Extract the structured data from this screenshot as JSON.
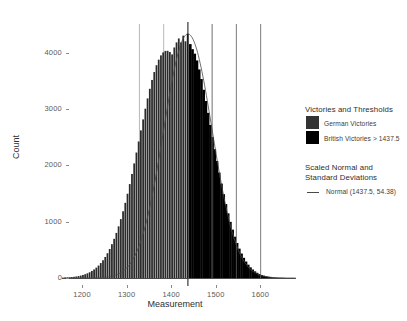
{
  "chart_data": {
    "type": "bar",
    "title": "",
    "xlabel": "Measurement",
    "ylabel": "Count",
    "xlim": [
      1155,
      1680
    ],
    "ylim": [
      0,
      4400
    ],
    "xticks": [
      1200,
      1300,
      1400,
      1500,
      1600
    ],
    "xtick_labels": [
      "1200",
      "1300",
      "1400",
      "1500",
      "1600"
    ],
    "yticks": [
      0,
      1000,
      2000,
      3000,
      4000
    ],
    "ytick_labels": [
      "0",
      "1000",
      "2000",
      "3000",
      "4000"
    ],
    "grid": false,
    "legend_position": "right",
    "bin_width": 5,
    "threshold": 1437.5,
    "normal_mean": 1437.5,
    "normal_sd": 54.38,
    "sd_lines": [
      1491.88,
      1546.26,
      1600.64,
      1383.12,
      1328.74
    ],
    "colors": {
      "german_bars": "#2b2b2b",
      "british_bars": "#000000",
      "normal_curve": "#4a4a4a",
      "threshold_line": "#111111",
      "axis": "#4a4a4a",
      "tick_text": "#5a5a5a",
      "background": "#ffffff"
    },
    "series": [
      {
        "name": "German Victories",
        "color": "#2b2b2b",
        "description": "Bins at or below the 1437.5 threshold"
      },
      {
        "name": "British Victories > 1437.5",
        "color": "#000000",
        "description": "Bins above the 1437.5 threshold"
      }
    ],
    "bins": [
      {
        "x": 1162.5,
        "count": 8
      },
      {
        "x": 1167.5,
        "count": 10
      },
      {
        "x": 1172.5,
        "count": 13
      },
      {
        "x": 1177.5,
        "count": 17
      },
      {
        "x": 1182.5,
        "count": 21
      },
      {
        "x": 1187.5,
        "count": 27
      },
      {
        "x": 1192.5,
        "count": 34
      },
      {
        "x": 1197.5,
        "count": 43
      },
      {
        "x": 1202.5,
        "count": 54
      },
      {
        "x": 1207.5,
        "count": 67
      },
      {
        "x": 1212.5,
        "count": 83
      },
      {
        "x": 1217.5,
        "count": 102
      },
      {
        "x": 1222.5,
        "count": 125
      },
      {
        "x": 1227.5,
        "count": 152
      },
      {
        "x": 1232.5,
        "count": 184
      },
      {
        "x": 1237.5,
        "count": 221
      },
      {
        "x": 1242.5,
        "count": 265
      },
      {
        "x": 1247.5,
        "count": 315
      },
      {
        "x": 1252.5,
        "count": 373
      },
      {
        "x": 1257.5,
        "count": 440
      },
      {
        "x": 1262.5,
        "count": 515
      },
      {
        "x": 1267.5,
        "count": 600
      },
      {
        "x": 1272.5,
        "count": 695
      },
      {
        "x": 1277.5,
        "count": 800
      },
      {
        "x": 1282.5,
        "count": 917
      },
      {
        "x": 1287.5,
        "count": 1045
      },
      {
        "x": 1292.5,
        "count": 1184
      },
      {
        "x": 1297.5,
        "count": 1334
      },
      {
        "x": 1302.5,
        "count": 1495
      },
      {
        "x": 1307.5,
        "count": 1666
      },
      {
        "x": 1312.5,
        "count": 1846
      },
      {
        "x": 1317.5,
        "count": 2033
      },
      {
        "x": 1322.5,
        "count": 2226
      },
      {
        "x": 1327.5,
        "count": 2422
      },
      {
        "x": 1332.5,
        "count": 2619
      },
      {
        "x": 1337.5,
        "count": 2814
      },
      {
        "x": 1342.5,
        "count": 3004
      },
      {
        "x": 1347.5,
        "count": 3186
      },
      {
        "x": 1352.5,
        "count": 3357
      },
      {
        "x": 1357.5,
        "count": 3514
      },
      {
        "x": 1362.5,
        "count": 3654
      },
      {
        "x": 1367.5,
        "count": 3775
      },
      {
        "x": 1372.5,
        "count": 3874
      },
      {
        "x": 1377.5,
        "count": 3950
      },
      {
        "x": 1382.5,
        "count": 4002
      },
      {
        "x": 1387.5,
        "count": 4029
      },
      {
        "x": 1392.5,
        "count": 4031
      },
      {
        "x": 1397.5,
        "count": 4010
      },
      {
        "x": 1402.5,
        "count": 3967
      },
      {
        "x": 1407.5,
        "count": 4090
      },
      {
        "x": 1412.5,
        "count": 4180
      },
      {
        "x": 1417.5,
        "count": 4250
      },
      {
        "x": 1422.5,
        "count": 4180
      },
      {
        "x": 1427.5,
        "count": 4300
      },
      {
        "x": 1432.5,
        "count": 4200
      },
      {
        "x": 1437.5,
        "count": 4330
      },
      {
        "x": 1442.5,
        "count": 4150
      },
      {
        "x": 1447.5,
        "count": 4060
      },
      {
        "x": 1452.5,
        "count": 3980
      },
      {
        "x": 1457.5,
        "count": 3860
      },
      {
        "x": 1462.5,
        "count": 3700
      },
      {
        "x": 1467.5,
        "count": 3530
      },
      {
        "x": 1472.5,
        "count": 3340
      },
      {
        "x": 1477.5,
        "count": 3140
      },
      {
        "x": 1482.5,
        "count": 2930
      },
      {
        "x": 1487.5,
        "count": 2715
      },
      {
        "x": 1492.5,
        "count": 2500
      },
      {
        "x": 1497.5,
        "count": 2285
      },
      {
        "x": 1502.5,
        "count": 2075
      },
      {
        "x": 1507.5,
        "count": 1870
      },
      {
        "x": 1512.5,
        "count": 1675
      },
      {
        "x": 1517.5,
        "count": 1487
      },
      {
        "x": 1522.5,
        "count": 1311
      },
      {
        "x": 1527.5,
        "count": 1147
      },
      {
        "x": 1532.5,
        "count": 996
      },
      {
        "x": 1537.5,
        "count": 858
      },
      {
        "x": 1542.5,
        "count": 733
      },
      {
        "x": 1547.5,
        "count": 621
      },
      {
        "x": 1552.5,
        "count": 521
      },
      {
        "x": 1557.5,
        "count": 434
      },
      {
        "x": 1562.5,
        "count": 358
      },
      {
        "x": 1567.5,
        "count": 292
      },
      {
        "x": 1572.5,
        "count": 236
      },
      {
        "x": 1577.5,
        "count": 189
      },
      {
        "x": 1582.5,
        "count": 150
      },
      {
        "x": 1587.5,
        "count": 118
      },
      {
        "x": 1592.5,
        "count": 92
      },
      {
        "x": 1597.5,
        "count": 71
      },
      {
        "x": 1602.5,
        "count": 54
      },
      {
        "x": 1607.5,
        "count": 41
      },
      {
        "x": 1612.5,
        "count": 31
      },
      {
        "x": 1617.5,
        "count": 23
      },
      {
        "x": 1622.5,
        "count": 17
      },
      {
        "x": 1627.5,
        "count": 12
      },
      {
        "x": 1632.5,
        "count": 9
      },
      {
        "x": 1637.5,
        "count": 6
      },
      {
        "x": 1642.5,
        "count": 4
      },
      {
        "x": 1647.5,
        "count": 3
      },
      {
        "x": 1652.5,
        "count": 2
      }
    ]
  },
  "legend": {
    "group1_title": "Victories and Thresholds",
    "items": [
      {
        "label": "German Victories",
        "color": "#333333",
        "marker": "swatch"
      },
      {
        "label": "British Victories > 1437.5",
        "color": "#000000",
        "marker": "swatch"
      }
    ],
    "group2_title_line1": "Scaled Normal and",
    "group2_title_line2": "Standard Deviations",
    "curve_item": {
      "label": "Normal (1437.5, 54.38)",
      "color": "#4a4a4a",
      "marker": "line"
    }
  }
}
